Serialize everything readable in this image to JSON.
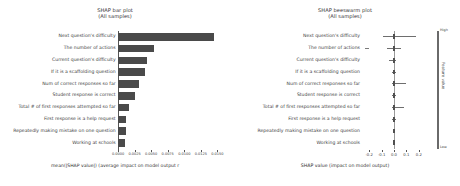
{
  "chart_data": [
    {
      "type": "bar",
      "title": "SHAP bar plot",
      "subtitle": "(All samples)",
      "orientation": "horizontal",
      "xlabel": "mean(|SHAP value|) (average impact on model output r",
      "ylabel": "",
      "xlim": [
        0,
        0.016
      ],
      "grid": false,
      "legend": "none",
      "xticklabels": [
        "0.0000",
        "0.0025",
        "0.0050",
        "0.0075",
        "0.0100",
        "0.0125",
        "0.0150"
      ],
      "xtickvalues": [
        0.0,
        0.0025,
        0.005,
        0.0075,
        0.01,
        0.0125,
        0.015
      ],
      "categories": [
        "Next question's difficulty",
        "The number of actions",
        "Current question's difficulty",
        "If it is a scaffolding question",
        "Num of correct responses so far",
        "Student response is correct",
        "Total # of first responses attempted so far",
        "First response is a help request",
        "Repeatedly making mistake on one question",
        "Working at schools"
      ],
      "values": [
        0.0145,
        0.0054,
        0.0044,
        0.004,
        0.0032,
        0.0026,
        0.0017,
        0.0012,
        0.0012,
        0.0011
      ],
      "bar_color": "#4a4a4a"
    },
    {
      "type": "scatter",
      "subtype": "beeswarm",
      "title": "SHAP beeswarm plot",
      "subtitle": "(All samples)",
      "xlabel": "SHAP value (impact on model output)",
      "ylabel": "",
      "xlim": [
        -0.25,
        0.25
      ],
      "grid": false,
      "xticklabels": [
        "-0.2",
        "-0.1",
        "0.0",
        "0.1",
        "0.2"
      ],
      "xtickvalues": [
        -0.2,
        -0.1,
        0.0,
        0.1,
        0.2
      ],
      "colorbar": {
        "label": "Feature value",
        "high_label": "High",
        "low_label": "Low"
      },
      "categories": [
        "Next question's difficulty",
        "The number of actions",
        "Current question's difficulty",
        "If it is a scaffolding question",
        "Num of correct responses so far",
        "Student response is correct",
        "Total # of first responses attempted so far",
        "First response is a help request",
        "Repeatedly making mistake on one question",
        "Working at schools"
      ],
      "spreads": [
        {
          "min": -0.085,
          "max": 0.175,
          "core_min": -0.012,
          "core_max": 0.012
        },
        {
          "min": -0.055,
          "max": 0.055,
          "core_min": -0.01,
          "core_max": 0.01,
          "outlier_min": -0.235,
          "outlier_max": -0.205
        },
        {
          "min": -0.04,
          "max": 0.02,
          "core_min": -0.008,
          "core_max": 0.008
        },
        {
          "min": -0.015,
          "max": 0.018,
          "core_min": -0.008,
          "core_max": 0.008
        },
        {
          "min": -0.018,
          "max": 0.095,
          "core_min": -0.008,
          "core_max": 0.01
        },
        {
          "min": -0.015,
          "max": 0.015,
          "core_min": -0.007,
          "core_max": 0.007
        },
        {
          "min": -0.015,
          "max": 0.082,
          "core_min": -0.007,
          "core_max": 0.008
        },
        {
          "min": -0.013,
          "max": 0.013,
          "core_min": -0.006,
          "core_max": 0.006
        },
        {
          "min": -0.012,
          "max": 0.012,
          "core_min": -0.006,
          "core_max": 0.006
        },
        {
          "min": -0.012,
          "max": 0.012,
          "core_min": -0.006,
          "core_max": 0.006
        }
      ]
    }
  ],
  "left": {
    "title": "SHAP bar plot",
    "subtitle": "(All samples)",
    "xlabel": "mean(|SHAP value|) (average impact on model output r"
  },
  "right": {
    "title": "SHAP beeswarm plot",
    "subtitle": "(All samples)",
    "xlabel": "SHAP value (impact on model output)",
    "colorbar_label": "Feature value",
    "colorbar_high": "High",
    "colorbar_low": "Low"
  }
}
